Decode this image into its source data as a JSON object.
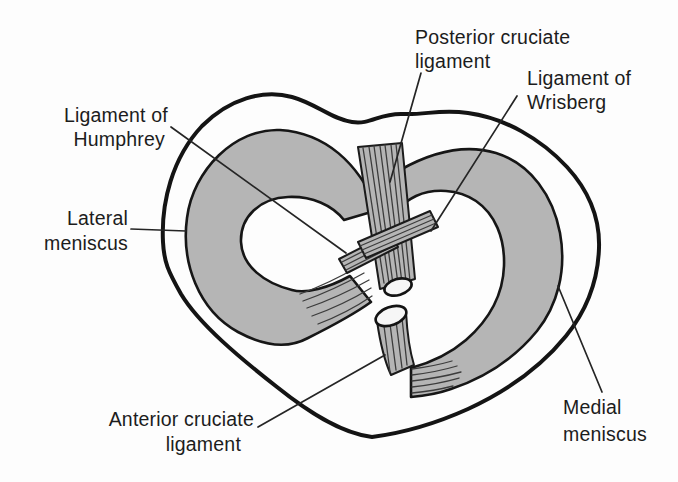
{
  "figure": {
    "labels": {
      "posterior_cruciate_ligament": {
        "line1": "Posterior cruciate",
        "line2": "ligament"
      },
      "ligament_of_wrisberg": {
        "line1": "Ligament of",
        "line2": "Wrisberg"
      },
      "ligament_of_humphrey": {
        "line1": "Ligament of",
        "line2": "Humphrey"
      },
      "lateral_meniscus": {
        "line1": "Lateral",
        "line2": "meniscus"
      },
      "anterior_cruciate_ligament": {
        "line1": "Anterior cruciate",
        "line2": "ligament"
      },
      "medial_meniscus": {
        "line1": "Medial",
        "line2": "meniscus"
      }
    },
    "colors": {
      "meniscus_gray": "#b5b5b5",
      "outline_black": "#141414",
      "background": "#fdfdfd",
      "label_text": "#1c1c1c"
    }
  }
}
